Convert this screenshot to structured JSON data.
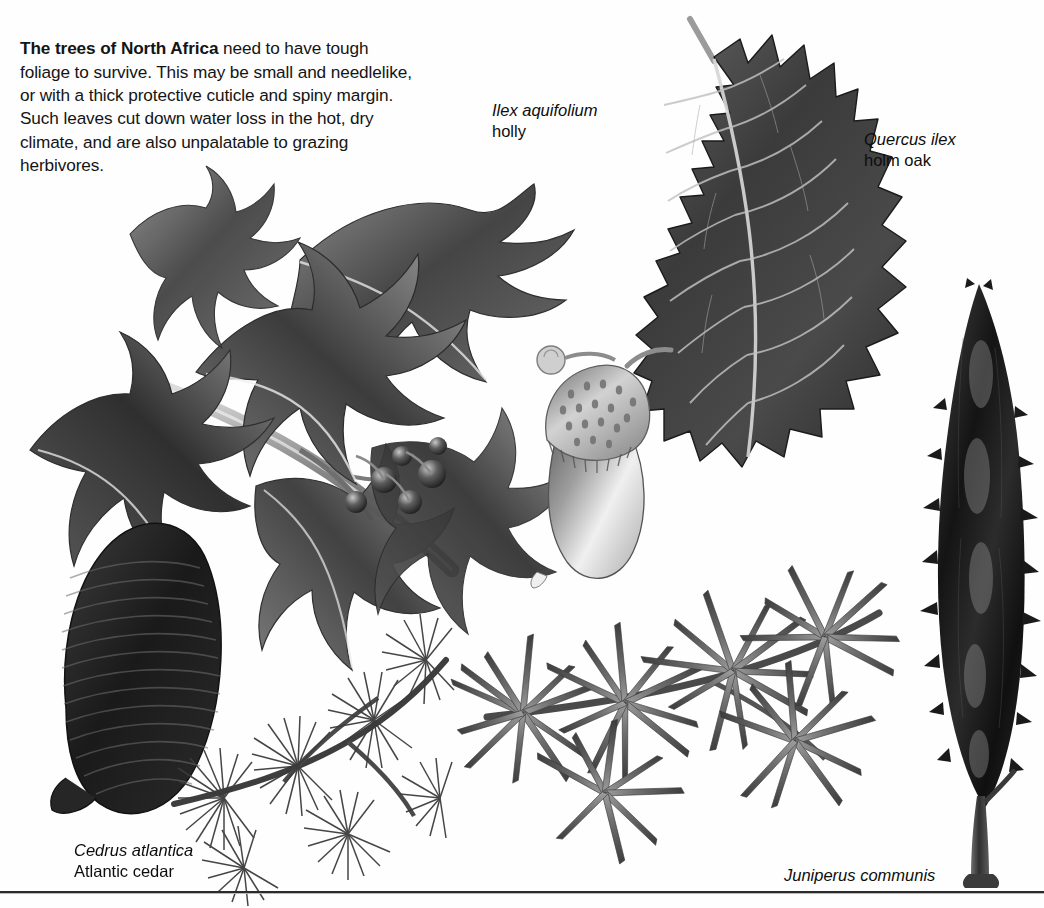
{
  "plate": {
    "background_color": "#fefefe",
    "rule_color": "#2b2b2b"
  },
  "intro": {
    "lead": "The trees of North Africa",
    "body": " need to have tough foliage to survive. This may be small and needlelike, or with a thick protective cuticle and spiny margin. Such leaves cut down water loss in the hot, dry climate, and are also unpalatable to grazing herbivores."
  },
  "captions": [
    {
      "id": "holly",
      "scientific_name": "Ilex aquifolium",
      "common_name": "holly"
    },
    {
      "id": "oak",
      "scientific_name": "Quercus ilex",
      "common_name": "holm oak"
    },
    {
      "id": "cedar",
      "scientific_name": "Cedrus atlantica",
      "common_name": "Atlantic cedar"
    },
    {
      "id": "juniper",
      "scientific_name": "Juniperus communis",
      "common_name": ""
    }
  ],
  "illustrations": [
    {
      "id": "holly-branch",
      "subject": "Ilex aquifolium branch with spiny leaves and berries",
      "ink": "#3a3a3a"
    },
    {
      "id": "holm-oak-leaf",
      "subject": "Quercus ilex leaf, dark with spiny-toothed margin and pale veins",
      "ink": "#4a4a4a"
    },
    {
      "id": "acorn",
      "subject": "Quercus ilex acorn in scaly cup",
      "ink": "#6e6e6e"
    },
    {
      "id": "cedar-cone-and-needles",
      "subject": "Cedrus atlantica barrel cone and needle rosettes on shoot",
      "ink": "#2a2a2a"
    },
    {
      "id": "juniper-sprig",
      "subject": "Juniperus communis shoot with whorls of sharp needles",
      "ink": "#555555"
    },
    {
      "id": "columnar-tree",
      "subject": "Juniperus communis columnar tree habit",
      "ink": "#1f1f1f"
    }
  ]
}
